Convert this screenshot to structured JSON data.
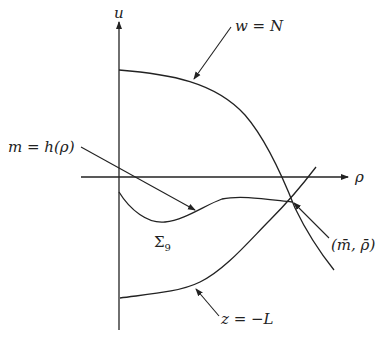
{
  "diagram": {
    "axes": {
      "vertical_label": "u",
      "horizontal_label": "ρ"
    },
    "labels": {
      "w_curve": "w = N",
      "m_curve": "m = h(ρ)",
      "region": "Σ",
      "region_sub": "9",
      "z_curve": "z = −L",
      "point": "(m̄, ρ̄)"
    },
    "colors": {
      "line": "#222222",
      "background": "#ffffff"
    }
  }
}
